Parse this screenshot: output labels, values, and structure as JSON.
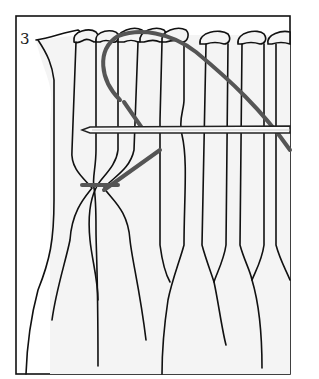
{
  "figure": {
    "step_number": "3",
    "colors": {
      "background": "#ffffff",
      "fabric": "#f4f4f4",
      "outline": "#111111",
      "thread": "#555555",
      "needle": "#fafafa"
    },
    "frame": {
      "x": 16,
      "y": 16,
      "width": 274,
      "height": 358
    },
    "elements": {
      "pleats": "11 vertical fabric pleats with rounded tops",
      "needle": "horizontal needle passing through pleats at mid height",
      "thread": "dark thread looping over top and back to gathering stitch",
      "gather_stitch": "stitch binding two pleats together below needle"
    }
  }
}
